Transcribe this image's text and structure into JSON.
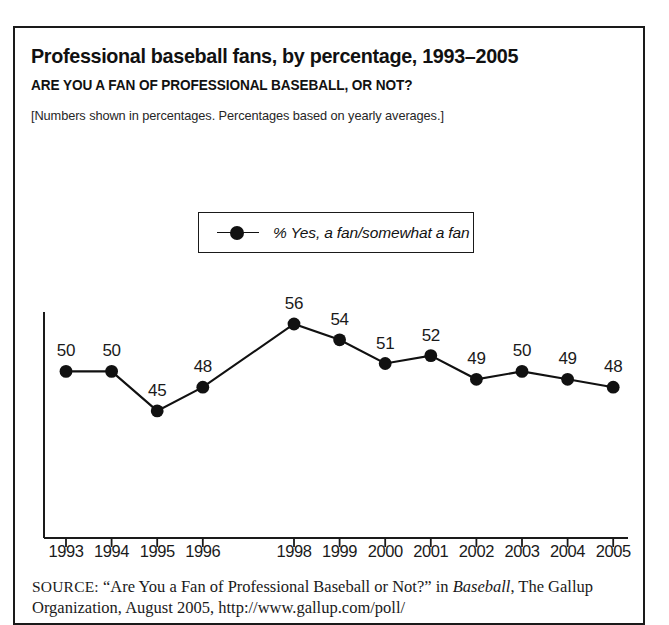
{
  "figure": {
    "number_label": "FIGURE 2.2"
  },
  "header": {
    "title": "Professional baseball fans, by percentage, 1993–2005",
    "question": "ARE YOU A FAN OF PROFESSIONAL BASEBALL, OR NOT?",
    "note": "[Numbers shown in percentages. Percentages based on yearly averages.]"
  },
  "legend": {
    "position": "top-center-inside-plot",
    "entries": [
      {
        "label": "% Yes, a fan/somewhat a fan",
        "marker": "filled-circle",
        "color": "#111111"
      }
    ]
  },
  "source": {
    "label": "SOURCE:",
    "text_part1": " “Are You a Fan of Professional Baseball or Not?” in ",
    "italic_work": "Baseball",
    "text_part2": ",",
    "line2": "The Gallup Organization, August 2005, http://www.gallup.com/poll/"
  },
  "chart_data": {
    "type": "line",
    "title": "Professional baseball fans, by percentage, 1993–2005",
    "subtitle": "ARE YOU A FAN OF PROFESSIONAL BASEBALL, OR NOT?",
    "annotation": "[Numbers shown in percentages. Percentages based on yearly averages.]",
    "xlabel": "",
    "ylabel": "",
    "grid": false,
    "legend_position": "top-center",
    "categories": [
      "1993",
      "1994",
      "1995",
      "1996",
      "1997",
      "1998",
      "1999",
      "2000",
      "2001",
      "2002",
      "2003",
      "2004",
      "2005"
    ],
    "tick_labels": [
      "1993",
      "1994",
      "1995",
      "1996",
      "",
      "1998",
      "1999",
      "2000",
      "2001",
      "2002",
      "2003",
      "2004",
      "2005"
    ],
    "series": [
      {
        "name": "% Yes, a fan/somewhat a fan",
        "color": "#111111",
        "marker": "filled-circle",
        "values": [
          50,
          50,
          45,
          48,
          null,
          56,
          54,
          51,
          52,
          49,
          50,
          49,
          48
        ],
        "data_labels": [
          "50",
          "50",
          "45",
          "48",
          "",
          "56",
          "54",
          "51",
          "52",
          "49",
          "50",
          "49",
          "48"
        ]
      }
    ],
    "ylim": [
      40,
      60
    ]
  }
}
